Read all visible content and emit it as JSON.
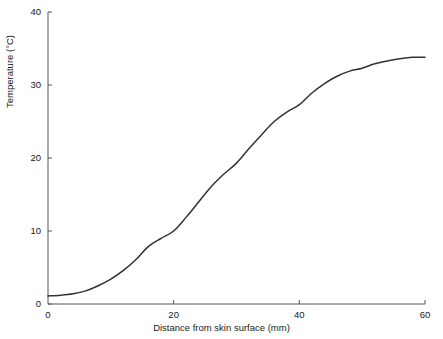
{
  "chart_data": {
    "type": "line",
    "title": "",
    "subtitle": "",
    "xlabel": "Distance from skin surface (mm)",
    "ylabel": "Temperature (°C)",
    "xlim": [
      0,
      60
    ],
    "ylim": [
      0,
      40
    ],
    "xticks": [
      0,
      20,
      40,
      60
    ],
    "yticks": [
      0,
      10,
      20,
      30,
      40
    ],
    "xtick_labels": [
      "0",
      "20",
      "40",
      "60"
    ],
    "ytick_labels": [
      "0",
      "10",
      "20",
      "30",
      "40"
    ],
    "grid": false,
    "legend": null,
    "legend_position": "none",
    "annotations": [],
    "series": [
      {
        "name": "Temperature profile",
        "color": "#333333",
        "line_width": 1.5,
        "x": [
          0,
          2,
          4,
          6,
          8,
          10,
          12,
          14,
          16,
          18,
          20,
          22,
          24,
          26,
          28,
          30,
          32,
          34,
          36,
          38,
          40,
          42,
          44,
          46,
          48,
          50,
          52,
          54,
          56,
          58,
          60
        ],
        "values": [
          1.1,
          1.2,
          1.4,
          1.8,
          2.5,
          3.4,
          4.6,
          6.1,
          7.9,
          9.0,
          10.0,
          11.9,
          14.0,
          16.1,
          17.8,
          19.3,
          21.3,
          23.2,
          25.0,
          26.3,
          27.3,
          28.9,
          30.2,
          31.2,
          31.9,
          32.3,
          32.9,
          33.3,
          33.6,
          33.8,
          33.8
        ]
      }
    ]
  },
  "axis_style": {
    "color": "#555555",
    "tick_color": "#555555",
    "tick_length": 4
  },
  "labels": {
    "x_title": "Distance from skin surface (mm)",
    "y_title": "Temperature (°C)"
  }
}
